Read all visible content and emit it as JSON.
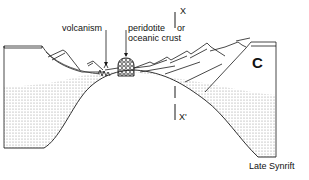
{
  "diagram": {
    "title": "Late Synrift",
    "labels": {
      "volcanism": "volcanism",
      "peridotite_line1": "peridotite",
      "peridotite_or": "or",
      "peridotite_line2": "oceanic crust",
      "section_top": "X",
      "section_bottom": "X'",
      "panel_letter": "C"
    },
    "colors": {
      "line": "#1a1a1a",
      "stipple": "#9a9a9a",
      "background": "#ffffff"
    }
  }
}
